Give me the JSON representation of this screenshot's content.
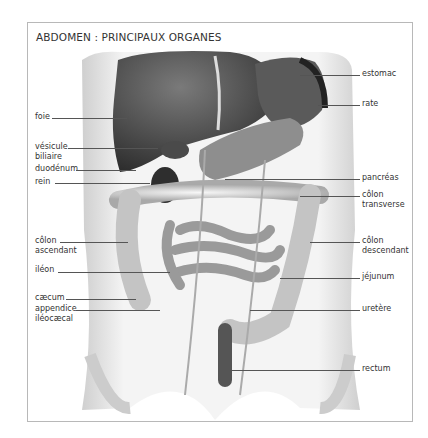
{
  "diagram": {
    "title": "ABDOMEN : PRINCIPAUX ORGANES",
    "colors": {
      "frame": "#b8b8b8",
      "text": "#333333",
      "leader": "#555555",
      "organ_dark": "#3a3a3a",
      "organ_light": "#d8d8d8"
    },
    "labels_left": [
      {
        "id": "foie",
        "lines": [
          "foie"
        ]
      },
      {
        "id": "vesicule-biliaire",
        "lines": [
          "vésicule",
          "biliaire"
        ]
      },
      {
        "id": "duodenum",
        "lines": [
          "duodénum"
        ]
      },
      {
        "id": "rein",
        "lines": [
          "rein"
        ]
      },
      {
        "id": "colon-ascendant",
        "lines": [
          "côlon",
          "ascendant"
        ]
      },
      {
        "id": "ileon",
        "lines": [
          "iléon"
        ]
      },
      {
        "id": "caecum",
        "lines": [
          "cæcum"
        ]
      },
      {
        "id": "appendice-ileocaecal",
        "lines": [
          "appendice",
          "iléocæcal"
        ]
      }
    ],
    "labels_right": [
      {
        "id": "estomac",
        "lines": [
          "estomac"
        ]
      },
      {
        "id": "rate",
        "lines": [
          "rate"
        ]
      },
      {
        "id": "pancreas",
        "lines": [
          "pancréas"
        ]
      },
      {
        "id": "colon-transverse",
        "lines": [
          "côlon",
          "transverse"
        ]
      },
      {
        "id": "colon-descendant",
        "lines": [
          "côlon",
          "descendant"
        ]
      },
      {
        "id": "jejunum",
        "lines": [
          "jéjunum"
        ]
      },
      {
        "id": "uretere",
        "lines": [
          "uretère"
        ]
      },
      {
        "id": "rectum",
        "lines": [
          "rectum"
        ]
      }
    ]
  }
}
